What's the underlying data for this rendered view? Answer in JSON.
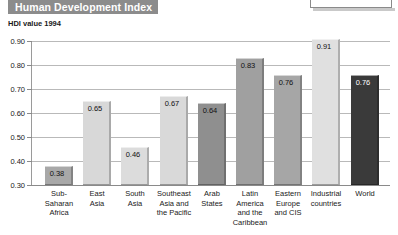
{
  "banner": {
    "title": "Human Development Index"
  },
  "clipped_box": {
    "text": "income"
  },
  "chart_data": {
    "type": "bar",
    "title": "Human Development Index",
    "subtitle": "HDI value 1994",
    "xlabel": "",
    "ylabel": "",
    "ylim": [
      0.3,
      0.9
    ],
    "ytick_labels": [
      "0.90",
      "0.80",
      "0.70",
      "0.60",
      "0.50",
      "0.40",
      "0.30"
    ],
    "yticks": [
      0.9,
      0.8,
      0.7,
      0.6,
      0.5,
      0.4,
      0.3
    ],
    "grid": true,
    "legend": "none",
    "categories": [
      "Sub-\nSaharan\nAfrica",
      "East\nAsia",
      "South\nAsia",
      "Southeast\nAsia and\nthe Pacific",
      "Arab\nStates",
      "Latin\nAmerica\nand the\nCaribbean",
      "Eastern\nEurope\nand CIS",
      "Industrial\ncountries",
      "World"
    ],
    "values": [
      0.38,
      0.65,
      0.46,
      0.67,
      0.64,
      0.83,
      0.76,
      0.91,
      0.76
    ],
    "value_labels": [
      "0.38",
      "0.65",
      "0.46",
      "0.67",
      "0.64",
      "0.83",
      "0.76",
      "0.91",
      "0.76"
    ],
    "bar_shades": [
      "mid",
      "light",
      "light",
      "light",
      "mid",
      "mid",
      "mid",
      "light",
      "dark"
    ],
    "bar_colors": [
      "#a8a8a8",
      "#d8d8d8",
      "#dcdcdc",
      "#d9d9d9",
      "#8f8f8f",
      "#a0a0a0",
      "#a6a6a6",
      "#e0e0e0",
      "#3a3a3a"
    ]
  }
}
